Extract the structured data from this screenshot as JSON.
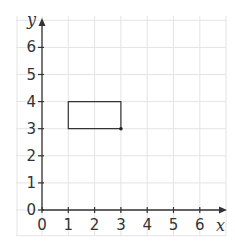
{
  "chart_data": {
    "type": "scatter",
    "title": "",
    "xlabel": "x",
    "ylabel": "y",
    "xlim": [
      0,
      7
    ],
    "ylim": [
      0,
      7
    ],
    "x_ticks": [
      0,
      1,
      2,
      3,
      4,
      5,
      6
    ],
    "y_ticks": [
      0,
      1,
      2,
      3,
      4,
      5,
      6
    ],
    "grid": true,
    "shapes": [
      {
        "type": "rectangle",
        "vertices": [
          [
            1,
            3
          ],
          [
            3,
            3
          ],
          [
            3,
            4
          ],
          [
            1,
            4
          ]
        ]
      }
    ],
    "points": [
      {
        "x": 3,
        "y": 3
      }
    ]
  },
  "axes": {
    "x_label": "x",
    "y_label": "y",
    "x_tick_labels": [
      "0",
      "1",
      "2",
      "3",
      "4",
      "5",
      "6"
    ],
    "y_tick_labels": [
      "0",
      "1",
      "2",
      "3",
      "4",
      "5",
      "6"
    ]
  },
  "colors": {
    "grid": "#e4e4e4",
    "axis": "#333333",
    "shape": "#333333"
  }
}
